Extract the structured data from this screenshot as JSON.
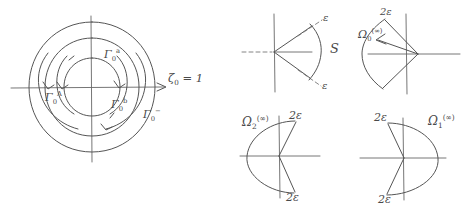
{
  "figure": {
    "ink_color": "#555555",
    "background": "#ffffff"
  },
  "panels": [
    {
      "id": "contour-panel",
      "name": "concentric-contour-diagram",
      "labels": {
        "gamma_a": "Γ₀ᵃ",
        "gamma_A": "Γ₀ᴬ",
        "gamma_b": "Γ₀ᵇ",
        "gamma_minus": "Γ₀⁻",
        "axis": "ζ₀ = 1"
      },
      "axis_label_parts": {
        "symbol": "ζ",
        "subscript": "0",
        "relation": "= 1"
      }
    },
    {
      "id": "sector-S-panel",
      "name": "sector-S-diagram",
      "labels": {
        "epsilon_upper": "ε",
        "epsilon_lower": "ε",
        "sector": "S"
      }
    },
    {
      "id": "omega-0-panel",
      "name": "omega-0-infinity-diagram",
      "labels": {
        "two_epsilon": "2ε",
        "omega": "Ω",
        "omega_subscript": "0",
        "omega_superscript": "(∞)"
      }
    },
    {
      "id": "omega-2-panel",
      "name": "omega-2-infinity-diagram",
      "labels": {
        "two_epsilon_top": "2ε",
        "two_epsilon_bottom": "2ε",
        "omega": "Ω",
        "omega_subscript": "2",
        "omega_superscript": "(∞)"
      }
    },
    {
      "id": "omega-1-panel",
      "name": "omega-1-infinity-diagram",
      "labels": {
        "two_epsilon_top": "2ε",
        "two_epsilon_bottom": "2ε",
        "omega": "Ω",
        "omega_subscript": "1",
        "omega_superscript": "(∞)"
      }
    }
  ]
}
